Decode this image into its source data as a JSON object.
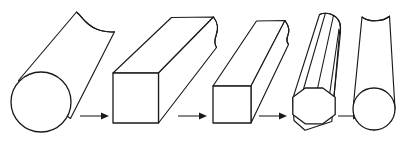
{
  "diagram": {
    "background_color": "#ffffff",
    "line_color": "#1a1a1a",
    "fill_color": "#ffffff",
    "canvas": {
      "width": 412,
      "height": 142
    },
    "stage_count": 5,
    "arrow_count": 4,
    "projection": "isometric",
    "stages": [
      {
        "index": 1,
        "name": "round-bar-initial",
        "cross_section": "circle",
        "label": "",
        "end_face": {
          "shape": "circle",
          "cx": 41,
          "cy": 102,
          "r": 30
        },
        "break_end": "torn",
        "facet_lines": 0
      },
      {
        "index": 2,
        "name": "square-bar-large",
        "cross_section": "square",
        "label": "",
        "end_face": {
          "shape": "square",
          "x": 113,
          "y": 73,
          "w": 46,
          "h": 50
        },
        "break_end": "torn",
        "facet_lines": 1
      },
      {
        "index": 3,
        "name": "square-bar-small",
        "cross_section": "square",
        "label": "",
        "end_face": {
          "shape": "square",
          "x": 213,
          "y": 86,
          "w": 38,
          "h": 37
        },
        "break_end": "torn",
        "facet_lines": 1
      },
      {
        "index": 4,
        "name": "octagonal-bar",
        "cross_section": "octagon",
        "label": "",
        "end_face": {
          "shape": "octagon",
          "cx": 314,
          "cy": 109,
          "r": 22
        },
        "break_end": "rounded",
        "facet_lines": 4
      },
      {
        "index": 5,
        "name": "round-bar-final",
        "cross_section": "circle",
        "label": "",
        "end_face": {
          "shape": "circle",
          "cx": 374,
          "cy": 109,
          "r": 21
        },
        "break_end": "torn",
        "facet_lines": 0
      }
    ],
    "arrows": [
      {
        "index": 1,
        "name": "arrow-1",
        "label": "",
        "x1": 80,
        "x2": 108,
        "y": 116,
        "direction": "right"
      },
      {
        "index": 2,
        "name": "arrow-2",
        "label": "",
        "x1": 178,
        "x2": 206,
        "y": 116,
        "direction": "right"
      },
      {
        "index": 3,
        "name": "arrow-3",
        "label": "",
        "x1": 259,
        "x2": 286,
        "y": 116,
        "direction": "right"
      },
      {
        "index": 4,
        "name": "arrow-4",
        "label": "",
        "x1": 338,
        "x2": 360,
        "y": 116,
        "direction": "right"
      }
    ]
  }
}
